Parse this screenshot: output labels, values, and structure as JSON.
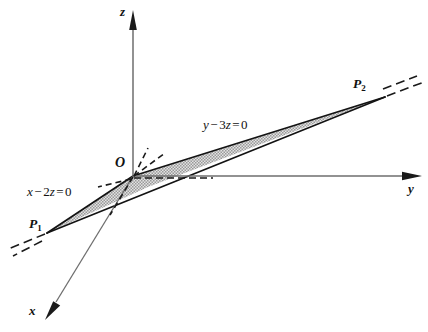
{
  "figure": {
    "background_color": "#ffffff",
    "axes": [
      {
        "name": "z",
        "label": "z",
        "direction": "up",
        "color": "#6e6e6e"
      },
      {
        "name": "y",
        "label": "y",
        "direction": "right",
        "color": "#6e6e6e"
      },
      {
        "name": "x",
        "label": "x",
        "direction": "down-left",
        "color": "#6e6e6e"
      }
    ],
    "origin": {
      "label": "O"
    },
    "points": [
      {
        "name": "P1",
        "label": "P",
        "subscript": "1"
      },
      {
        "name": "P2",
        "label": "P",
        "subscript": "2"
      }
    ],
    "equations": [
      {
        "name": "plane-x-2z",
        "lhs_var": "x",
        "op": "−",
        "coef": "2",
        "term_var": "z",
        "rel": "=",
        "rhs": "0",
        "text": "x − 2z = 0"
      },
      {
        "name": "plane-y-3z",
        "lhs_var": "y",
        "op": "−",
        "coef": "3",
        "term_var": "z",
        "rel": "=",
        "rhs": "0",
        "text": "y − 3z = 0"
      }
    ],
    "region": {
      "name": "shaded-strip",
      "fill": "#b9b9b9",
      "stroke": "#111111",
      "pattern": "stipple"
    },
    "colors": {
      "ink": "#111111",
      "axis": "#6e6e6e",
      "shade": "#b9b9b9"
    }
  }
}
